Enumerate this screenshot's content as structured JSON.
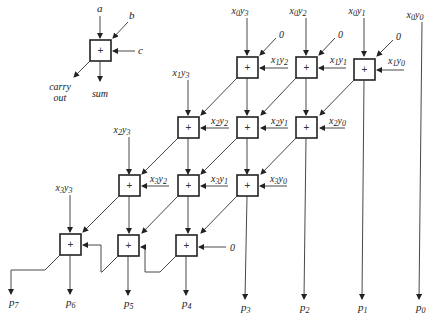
{
  "legend": {
    "input_a": "a",
    "input_b": "b",
    "input_c": "c",
    "operator": "+",
    "carry_out_line1": "carry",
    "carry_out_line2": "out",
    "sum": "sum"
  },
  "partial_products": {
    "x0y3": {
      "x": "x",
      "xs": "0",
      "y": "y",
      "ys": "3"
    },
    "x0y2": {
      "x": "x",
      "xs": "0",
      "y": "y",
      "ys": "2"
    },
    "x0y1": {
      "x": "x",
      "xs": "0",
      "y": "y",
      "ys": "1"
    },
    "x0y0": {
      "x": "x",
      "xs": "0",
      "y": "y",
      "ys": "0"
    },
    "x1y3": {
      "x": "x",
      "xs": "1",
      "y": "y",
      "ys": "3"
    },
    "x1y2": {
      "x": "x",
      "xs": "1",
      "y": "y",
      "ys": "2"
    },
    "x1y1": {
      "x": "x",
      "xs": "1",
      "y": "y",
      "ys": "1"
    },
    "x1y0": {
      "x": "x",
      "xs": "1",
      "y": "y",
      "ys": "0"
    },
    "x2y3": {
      "x": "x",
      "xs": "2",
      "y": "y",
      "ys": "3"
    },
    "x2y2": {
      "x": "x",
      "xs": "2",
      "y": "y",
      "ys": "2"
    },
    "x2y1": {
      "x": "x",
      "xs": "2",
      "y": "y",
      "ys": "1"
    },
    "x2y0": {
      "x": "x",
      "xs": "2",
      "y": "y",
      "ys": "0"
    },
    "x3y3": {
      "x": "x",
      "xs": "3",
      "y": "y",
      "ys": "3"
    },
    "x3y2": {
      "x": "x",
      "xs": "3",
      "y": "y",
      "ys": "2"
    },
    "x3y1": {
      "x": "x",
      "xs": "3",
      "y": "y",
      "ys": "1"
    },
    "x3y0": {
      "x": "x",
      "xs": "3",
      "y": "y",
      "ys": "0"
    }
  },
  "zero_inputs": [
    "0",
    "0",
    "0",
    "0"
  ],
  "adder_symbol": "+",
  "outputs": [
    {
      "p": "p",
      "s": "7"
    },
    {
      "p": "p",
      "s": "6"
    },
    {
      "p": "p",
      "s": "5"
    },
    {
      "p": "p",
      "s": "4"
    },
    {
      "p": "p",
      "s": "3"
    },
    {
      "p": "p",
      "s": "2"
    },
    {
      "p": "p",
      "s": "1"
    },
    {
      "p": "p",
      "s": "0"
    }
  ]
}
